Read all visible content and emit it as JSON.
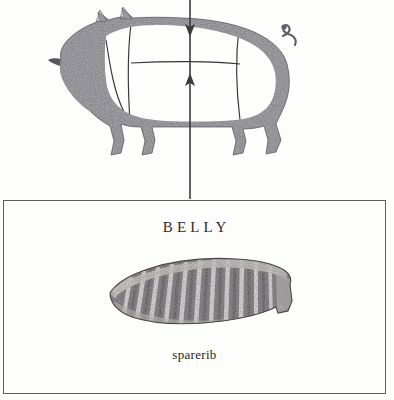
{
  "diagram": {
    "type": "butchery-cut-chart",
    "animal": "pig",
    "title_text": "BELLY",
    "caption_text": "sparerib",
    "pointer": {
      "down_arrow_label": "pointer-down-to-back",
      "up_arrow_label": "pointer-up-to-belly"
    },
    "colors": {
      "ink": "#2b2b30",
      "box_border": "#5d5d62",
      "silhouette": "#6e6e73",
      "silhouette_dark": "#4a4a50",
      "meat_dark": "#5a565a",
      "meat_mid": "#8d8a8d",
      "meat_light": "#e8e6e2",
      "paper": "#fdfdfc",
      "line": "#34343a"
    },
    "pig": {
      "parts": [
        {
          "name": "head",
          "label": "head"
        },
        {
          "name": "ear",
          "label": "ear"
        },
        {
          "name": "snout",
          "label": "snout"
        },
        {
          "name": "tail",
          "label": "tail"
        },
        {
          "name": "back",
          "label": "back"
        },
        {
          "name": "belly",
          "label": "belly"
        },
        {
          "name": "foreleg",
          "label": "foreleg"
        },
        {
          "name": "hindleg",
          "label": "hindleg"
        }
      ],
      "cut_sections": [
        {
          "name": "shoulder",
          "label": "shoulder"
        },
        {
          "name": "loin",
          "label": "loin"
        },
        {
          "name": "belly-section",
          "label": "belly"
        },
        {
          "name": "ham",
          "label": "ham"
        }
      ]
    }
  }
}
